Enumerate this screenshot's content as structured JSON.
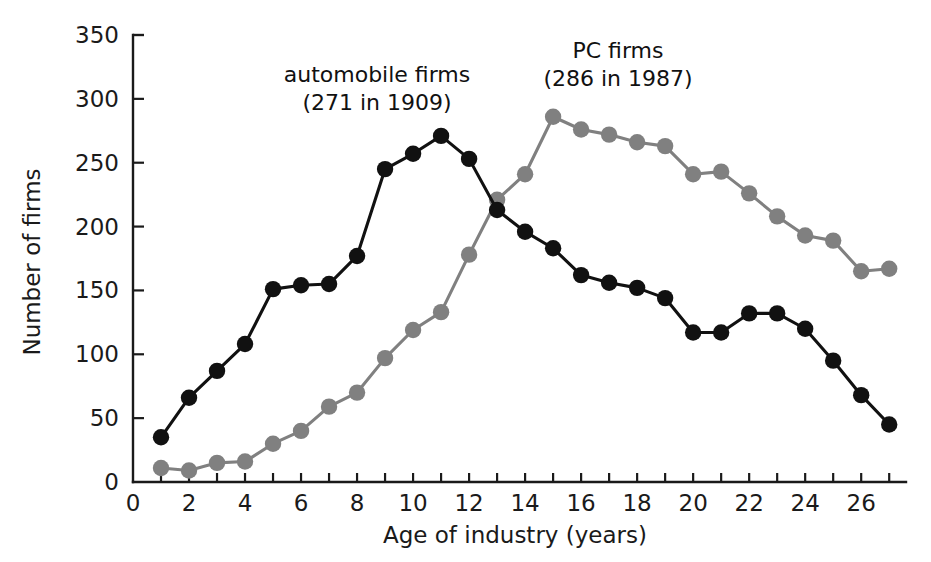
{
  "chart_data": {
    "type": "line",
    "title": "",
    "xlabel": "Age of industry (years)",
    "ylabel": "Number of firms",
    "xlim": [
      0,
      27.6
    ],
    "ylim": [
      0,
      350
    ],
    "xticks": [
      0,
      2,
      4,
      6,
      8,
      10,
      12,
      14,
      16,
      18,
      20,
      22,
      24,
      26
    ],
    "xtick_labels": [
      "0",
      "2",
      "4",
      "6",
      "8",
      "10",
      "12",
      "14",
      "16",
      "18",
      "20",
      "22",
      "24",
      "26"
    ],
    "xminor_ticks": [
      1,
      3,
      5,
      7,
      9,
      11,
      13,
      15,
      17,
      19,
      21,
      23,
      25,
      27
    ],
    "yticks": [
      0,
      50,
      100,
      150,
      200,
      250,
      300,
      350
    ],
    "ytick_labels": [
      "0",
      "50",
      "100",
      "150",
      "200",
      "250",
      "300",
      "350"
    ],
    "grid": false,
    "legend": "annotations-inline",
    "x": [
      1,
      2,
      3,
      4,
      5,
      6,
      7,
      8,
      9,
      10,
      11,
      12,
      13,
      14,
      15,
      16,
      17,
      18,
      19,
      20,
      21,
      22,
      23,
      24,
      25,
      26,
      27
    ],
    "series": [
      {
        "name": "automobile firms",
        "color": "#111111",
        "marker": "circle",
        "values": [
          35,
          66,
          87,
          108,
          151,
          154,
          155,
          177,
          245,
          257,
          271,
          253,
          213,
          196,
          183,
          162,
          156,
          152,
          144,
          117,
          117,
          132,
          132,
          120,
          95,
          68,
          45
        ]
      },
      {
        "name": "PC firms",
        "color": "#808080",
        "marker": "circle",
        "values": [
          11,
          9,
          15,
          16,
          30,
          40,
          59,
          70,
          97,
          119,
          133,
          178,
          221,
          241,
          286,
          276,
          272,
          266,
          263,
          241,
          243,
          226,
          208,
          193,
          189,
          165,
          167
        ]
      }
    ],
    "annotations": [
      {
        "name": "automobile-firms-label",
        "lines": [
          "automobile firms",
          "(271 in 1909)"
        ],
        "x_px": 377,
        "y_px": 82
      },
      {
        "name": "pc-firms-label",
        "lines": [
          "PC firms",
          "(286 in 1987)"
        ],
        "x_px": 618,
        "y_px": 58
      }
    ]
  },
  "axes": {
    "y_title": "Number of firms",
    "x_title": "Age of industry (years)"
  }
}
